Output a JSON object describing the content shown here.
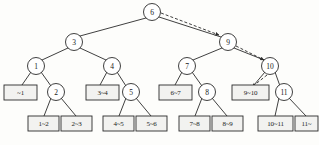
{
  "diagram": {
    "colors": {
      "stroke": "#2a2a2a",
      "text": "#1a1a1a",
      "node_fill": "#ffffff",
      "leaf_fill": "#f2f2f0",
      "background": "#fdfdfb",
      "path_dash": "#2a2a2a"
    },
    "internal_nodes": [
      {
        "id": "n6",
        "label": "6",
        "x": 152,
        "y": 12,
        "r": 8.5
      },
      {
        "id": "n3",
        "label": "3",
        "x": 74,
        "y": 42,
        "r": 8.5
      },
      {
        "id": "n9",
        "label": "9",
        "x": 228,
        "y": 42,
        "r": 8.5
      },
      {
        "id": "n1",
        "label": "1",
        "x": 36,
        "y": 66,
        "r": 8.5
      },
      {
        "id": "n4",
        "label": "4",
        "x": 112,
        "y": 66,
        "r": 8.5
      },
      {
        "id": "n7",
        "label": "7",
        "x": 187,
        "y": 66,
        "r": 8.5
      },
      {
        "id": "n10",
        "label": "10",
        "x": 270,
        "y": 66,
        "r": 8.5
      },
      {
        "id": "n2",
        "label": "2",
        "x": 56,
        "y": 92,
        "r": 8.5
      },
      {
        "id": "n5",
        "label": "5",
        "x": 131,
        "y": 92,
        "r": 8.5
      },
      {
        "id": "n8",
        "label": "8",
        "x": 207,
        "y": 92,
        "r": 8.5
      },
      {
        "id": "n11",
        "label": "11",
        "x": 284,
        "y": 92,
        "r": 8.5
      }
    ],
    "leaf_boxes": [
      {
        "id": "l_a",
        "label": "~1",
        "x": 4,
        "y": 85,
        "w": 33,
        "h": 15
      },
      {
        "id": "l_b",
        "label": "3~4",
        "x": 86,
        "y": 85,
        "w": 33,
        "h": 15
      },
      {
        "id": "l_c",
        "label": "6~7",
        "x": 159,
        "y": 85,
        "w": 33,
        "h": 15
      },
      {
        "id": "l_d",
        "label": "9~10",
        "x": 232,
        "y": 85,
        "w": 37,
        "h": 15
      },
      {
        "id": "l_e",
        "label": "1~2",
        "x": 28,
        "y": 116,
        "w": 31,
        "h": 15
      },
      {
        "id": "l_f",
        "label": "2~3",
        "x": 61,
        "y": 116,
        "w": 31,
        "h": 15
      },
      {
        "id": "l_g",
        "label": "4~5",
        "x": 103,
        "y": 116,
        "w": 31,
        "h": 15
      },
      {
        "id": "l_h",
        "label": "5~6",
        "x": 136,
        "y": 116,
        "w": 31,
        "h": 15
      },
      {
        "id": "l_i",
        "label": "7~8",
        "x": 179,
        "y": 116,
        "w": 31,
        "h": 15
      },
      {
        "id": "l_j",
        "label": "8~9",
        "x": 212,
        "y": 116,
        "w": 31,
        "h": 15
      },
      {
        "id": "l_k",
        "label": "10~11",
        "x": 258,
        "y": 116,
        "w": 35,
        "h": 15
      },
      {
        "id": "l_l",
        "label": "11~",
        "x": 295,
        "y": 116,
        "w": 23,
        "h": 15
      }
    ],
    "edges": [
      {
        "from": "n6",
        "to": "n3",
        "x1": 146,
        "y1": 18,
        "x2": 80,
        "y2": 36
      },
      {
        "from": "n6",
        "to": "n9",
        "x1": 159,
        "y1": 17,
        "x2": 221,
        "y2": 37
      },
      {
        "from": "n3",
        "to": "n1",
        "x1": 68,
        "y1": 48,
        "x2": 42,
        "y2": 60
      },
      {
        "from": "n3",
        "to": "n4",
        "x1": 80,
        "y1": 48,
        "x2": 106,
        "y2": 60
      },
      {
        "from": "n9",
        "to": "n7",
        "x1": 222,
        "y1": 48,
        "x2": 193,
        "y2": 60
      },
      {
        "from": "n9",
        "to": "n10",
        "x1": 234,
        "y1": 48,
        "x2": 264,
        "y2": 60
      },
      {
        "from": "n1",
        "to": "l_a",
        "x1": 31,
        "y1": 72,
        "x2": 22,
        "y2": 85
      },
      {
        "from": "n1",
        "to": "n2",
        "x1": 41,
        "y1": 72,
        "x2": 51,
        "y2": 86
      },
      {
        "from": "n4",
        "to": "l_b",
        "x1": 107,
        "y1": 72,
        "x2": 100,
        "y2": 85
      },
      {
        "from": "n4",
        "to": "n5",
        "x1": 117,
        "y1": 72,
        "x2": 126,
        "y2": 86
      },
      {
        "from": "n7",
        "to": "l_c",
        "x1": 182,
        "y1": 72,
        "x2": 175,
        "y2": 85
      },
      {
        "from": "n7",
        "to": "n8",
        "x1": 192,
        "y1": 72,
        "x2": 202,
        "y2": 86
      },
      {
        "from": "n10",
        "to": "l_d",
        "x1": 265,
        "y1": 72,
        "x2": 254,
        "y2": 85
      },
      {
        "from": "n10",
        "to": "n11",
        "x1": 275,
        "y1": 72,
        "x2": 280,
        "y2": 86
      },
      {
        "from": "n2",
        "to": "l_e",
        "x1": 51,
        "y1": 98,
        "x2": 44,
        "y2": 116
      },
      {
        "from": "n2",
        "to": "l_f",
        "x1": 61,
        "y1": 98,
        "x2": 76,
        "y2": 116
      },
      {
        "from": "n5",
        "to": "l_g",
        "x1": 126,
        "y1": 98,
        "x2": 119,
        "y2": 116
      },
      {
        "from": "n5",
        "to": "l_h",
        "x1": 136,
        "y1": 98,
        "x2": 151,
        "y2": 116
      },
      {
        "from": "n8",
        "to": "l_i",
        "x1": 202,
        "y1": 98,
        "x2": 195,
        "y2": 116
      },
      {
        "from": "n8",
        "to": "l_j",
        "x1": 212,
        "y1": 98,
        "x2": 227,
        "y2": 116
      },
      {
        "from": "n11",
        "to": "l_k",
        "x1": 279,
        "y1": 98,
        "x2": 275,
        "y2": 116
      },
      {
        "from": "n11",
        "to": "l_l",
        "x1": 289,
        "y1": 98,
        "x2": 306,
        "y2": 116
      }
    ],
    "search_path": {
      "description": "dashed arrows tracing search from root 6 to leaf 9~10",
      "segments": [
        {
          "from": "n6",
          "to": "n9",
          "x1": 161,
          "y1": 13,
          "x2": 219,
          "y2": 35
        },
        {
          "from": "n9",
          "to": "n10",
          "x1": 236,
          "y1": 46,
          "x2": 264,
          "y2": 60
        },
        {
          "from": "n10",
          "to": "l_d",
          "x1": 267,
          "y1": 75,
          "x2": 252,
          "y2": 87
        }
      ]
    }
  }
}
